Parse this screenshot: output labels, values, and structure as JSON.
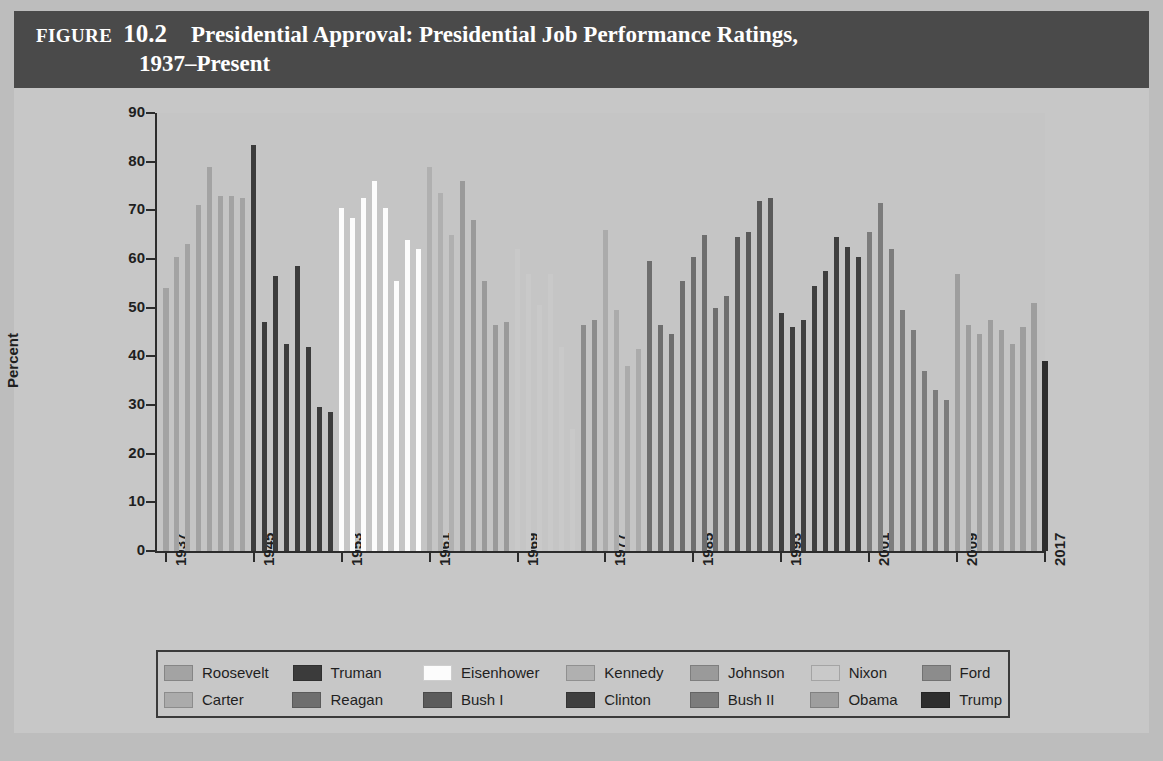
{
  "header": {
    "figure_word": "Figure",
    "figure_number": "10.2",
    "title_line1": "Presidential Approval: Presidential Job Performance Ratings,",
    "title_line2": "1937–Present",
    "bg_color": "#4a4a4a",
    "text_color": "#ffffff"
  },
  "chart_data": {
    "type": "bar",
    "title": "Presidential Approval: Presidential Job Performance Ratings, 1937–Present",
    "xlabel": "Year",
    "ylabel": "Percent",
    "ylim": [
      0,
      90
    ],
    "yticks": [
      0,
      10,
      20,
      30,
      40,
      50,
      60,
      70,
      80,
      90
    ],
    "xticks": [
      1937,
      1945,
      1953,
      1961,
      1969,
      1977,
      1985,
      1993,
      2001,
      2009,
      2017
    ],
    "xlim": [
      1936.5,
      2017.5
    ],
    "grid": false,
    "legend_position": "below",
    "series": [
      {
        "name": "Roosevelt",
        "color": "#a3a3a3",
        "x": [
          1937,
          1938,
          1939,
          1940,
          1941,
          1942,
          1943,
          1944
        ],
        "values": [
          54,
          60.5,
          63,
          71,
          79,
          73,
          73,
          72.5
        ]
      },
      {
        "name": "Truman",
        "color": "#3b3b3b",
        "x": [
          1945,
          1946,
          1947,
          1948,
          1949,
          1950,
          1951,
          1952
        ],
        "values": [
          83.5,
          47,
          56.5,
          42.5,
          58.5,
          42,
          29.5,
          28.5
        ]
      },
      {
        "name": "Eisenhower",
        "color": "#fcfcfc",
        "x": [
          1953,
          1954,
          1955,
          1956,
          1957,
          1958,
          1959,
          1960
        ],
        "values": [
          70.5,
          68.5,
          72.5,
          76,
          70.5,
          55.5,
          64,
          62
        ]
      },
      {
        "name": "Kennedy",
        "color": "#b0b0b0",
        "x": [
          1961,
          1962,
          1963
        ],
        "values": [
          79,
          73.5,
          65
        ]
      },
      {
        "name": "Johnson",
        "color": "#9a9a9a",
        "x": [
          1964,
          1965,
          1966,
          1967,
          1968
        ],
        "values": [
          76,
          68,
          55.5,
          46.5,
          47
        ]
      },
      {
        "name": "Nixon",
        "color": "#c9c9c9",
        "x": [
          1969,
          1970,
          1971,
          1972,
          1973,
          1974
        ],
        "values": [
          62,
          57,
          50.5,
          57,
          42,
          25
        ]
      },
      {
        "name": "Ford",
        "color": "#8c8c8c",
        "x": [
          1975,
          1976
        ],
        "values": [
          46.5,
          47.5
        ]
      },
      {
        "name": "Carter",
        "color": "#ababab",
        "x": [
          1977,
          1978,
          1979,
          1980
        ],
        "values": [
          66,
          49.5,
          38,
          41.5
        ]
      },
      {
        "name": "Reagan",
        "color": "#6e6e6e",
        "x": [
          1981,
          1982,
          1983,
          1984,
          1985,
          1986,
          1987,
          1988
        ],
        "values": [
          59.5,
          46.5,
          44.5,
          55.5,
          60.5,
          65,
          50,
          52.5
        ]
      },
      {
        "name": "Bush I",
        "color": "#5b5b5b",
        "x": [
          1989,
          1990,
          1991,
          1992
        ],
        "values": [
          64.5,
          65.5,
          72,
          72.5
        ]
      },
      {
        "name": "Clinton",
        "color": "#3f3f3f",
        "x": [
          1993,
          1994,
          1995,
          1996,
          1997,
          1998,
          1999,
          2000
        ],
        "values": [
          49,
          46,
          47.5,
          54.5,
          57.5,
          64.5,
          62.5,
          60.5
        ]
      },
      {
        "name": "Bush II",
        "color": "#7c7c7c",
        "x": [
          2001,
          2002,
          2003,
          2004,
          2005,
          2006,
          2007,
          2008
        ],
        "values": [
          65.5,
          71.5,
          62,
          49.5,
          45.5,
          37,
          33,
          31
        ]
      },
      {
        "name": "Obama",
        "color": "#9e9e9e",
        "x": [
          2009,
          2010,
          2011,
          2012,
          2013,
          2014,
          2015,
          2016
        ],
        "values": [
          57,
          46.5,
          44.5,
          47.5,
          45.5,
          42.5,
          46,
          51
        ]
      },
      {
        "name": "Trump",
        "color": "#2e2e2e",
        "x": [
          2017
        ],
        "values": [
          39
        ]
      }
    ]
  },
  "legend": {
    "row1": [
      "Roosevelt",
      "Truman",
      "Eisenhower",
      "Kennedy",
      "Johnson",
      "Nixon",
      "Ford"
    ],
    "row2": [
      "Carter",
      "Reagan",
      "Bush I",
      "Clinton",
      "Bush II",
      "Obama",
      "Trump"
    ]
  }
}
